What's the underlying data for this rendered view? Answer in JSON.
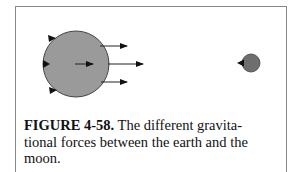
{
  "figure": {
    "label": "FIGURE 4-58.",
    "caption_line1": " The different gravita-",
    "caption_line2": "tional forces between the earth and the",
    "caption_line3": "moon.",
    "earth": {
      "name": "earth",
      "color": "#9a9a9a"
    },
    "moon": {
      "name": "moon",
      "color": "#6e6e6e"
    }
  }
}
